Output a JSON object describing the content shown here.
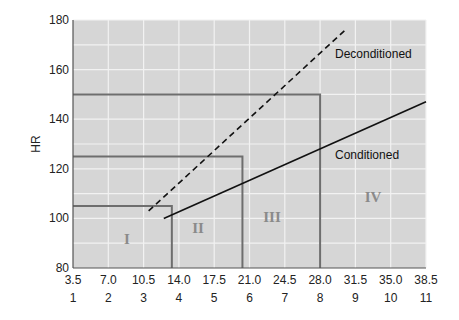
{
  "chart_data": {
    "type": "line",
    "title": "",
    "xlabel": "",
    "ylabel": "HR",
    "ylim": [
      80,
      180
    ],
    "xlim": [
      3.5,
      38.5
    ],
    "grid": true,
    "y_ticks": [
      "80",
      "100",
      "120",
      "140",
      "160",
      "180"
    ],
    "x_ticks_primary": [
      "3.5",
      "7.0",
      "10.5",
      "14.0",
      "17.5",
      "21.0",
      "24.5",
      "28.0",
      "31.5",
      "35.0",
      "38.5"
    ],
    "x_ticks_secondary": [
      "1",
      "2",
      "3",
      "4",
      "5",
      "6",
      "7",
      "8",
      "9",
      "10",
      "11"
    ],
    "series": [
      {
        "name": "Deconditioned",
        "style": "dashed",
        "x": [
          11.0,
          30.5
        ],
        "y": [
          103,
          176
        ]
      },
      {
        "name": "Conditioned",
        "style": "solid",
        "x": [
          12.5,
          38.5
        ],
        "y": [
          100,
          147
        ]
      }
    ],
    "regions": [
      {
        "label": "I",
        "x_max": 13.3,
        "hr_max": 105
      },
      {
        "label": "II",
        "x_max": 20.3,
        "hr_max": 125
      },
      {
        "label": "III",
        "x_max": 28.0,
        "hr_max": 150
      },
      {
        "label": "IV",
        "x_max": 38.5,
        "hr_max": 180
      }
    ],
    "annotations": [
      "Deconditioned",
      "Conditioned"
    ],
    "colors": {
      "background": "#d6d6d6",
      "grid": "#f2f2f2",
      "box": "#6e6e6e",
      "line": "#111111",
      "roman": "#8a8a8a"
    }
  }
}
